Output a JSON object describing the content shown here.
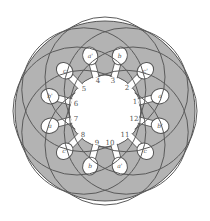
{
  "diagram": {
    "title": "",
    "colors": {
      "core_fill": "#b3b3b3",
      "outline": "#555555",
      "bore_fill": "#ffffff",
      "coil_stroke": "#5a5a5a",
      "background": "#ffffff"
    },
    "slot_count": 12,
    "slot_numbers": [
      {
        "label": "1",
        "x": 135,
        "y": 104
      },
      {
        "label": "2",
        "x": 127,
        "y": 90
      },
      {
        "label": "3",
        "x": 113,
        "y": 83
      },
      {
        "label": "4",
        "x": 98,
        "y": 83
      },
      {
        "label": "5",
        "x": 84,
        "y": 91
      },
      {
        "label": "6",
        "x": 76,
        "y": 106
      },
      {
        "label": "7",
        "x": 76,
        "y": 121
      },
      {
        "label": "8",
        "x": 83,
        "y": 137
      },
      {
        "label": "9",
        "x": 97,
        "y": 145
      },
      {
        "label": "10",
        "x": 110,
        "y": 145
      },
      {
        "label": "11",
        "x": 125,
        "y": 137
      },
      {
        "label": "12",
        "x": 134,
        "y": 121
      }
    ],
    "coil_marks": [
      {
        "label": "a",
        "slot": 1
      },
      {
        "label": "c'",
        "slot": 2
      },
      {
        "label": "b",
        "slot": 3
      },
      {
        "label": "a'",
        "slot": 4
      },
      {
        "label": "c",
        "slot": 5
      },
      {
        "label": "b'",
        "slot": 6
      },
      {
        "label": "a",
        "slot": 7
      },
      {
        "label": "c'",
        "slot": 8
      },
      {
        "label": "b",
        "slot": 9
      },
      {
        "label": "a'",
        "slot": 10
      },
      {
        "label": "c",
        "slot": 11
      },
      {
        "label": "b'",
        "slot": 12
      }
    ]
  }
}
